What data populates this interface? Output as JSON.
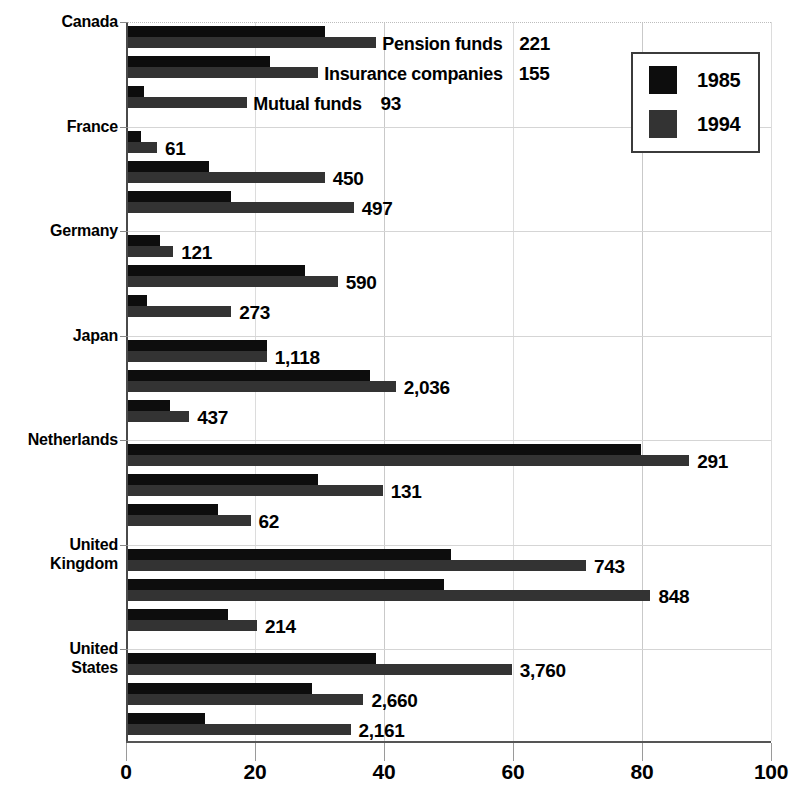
{
  "chart_data": {
    "type": "bar",
    "orientation": "horizontal",
    "title": "",
    "xlabel": "",
    "ylabel": "",
    "xlim": [
      0,
      100
    ],
    "xticks": [
      0,
      20,
      40,
      60,
      80,
      100
    ],
    "xtick_labels": [
      "0",
      "20",
      "40",
      "60",
      "80",
      "100"
    ],
    "grid": true,
    "legend_position": "top-right",
    "legend": [
      {
        "name": "1985",
        "color": "#0d0d0d"
      },
      {
        "name": "1994",
        "color": "#333333"
      }
    ],
    "categories": [
      "Canada",
      "France",
      "Germany",
      "Japan",
      "Netherlands",
      "United Kingdom",
      "United States"
    ],
    "subcategories": [
      "Pension funds",
      "Insurance companies",
      "Mutual funds"
    ],
    "groups": [
      {
        "category": "Canada",
        "label_lines": "Canada",
        "rows": [
          {
            "series": "Pension funds",
            "show_series_name": true,
            "v1985": 30.5,
            "v1994": 38.5,
            "value_label": "221"
          },
          {
            "series": "Insurance companies",
            "show_series_name": true,
            "v1985": 22.0,
            "v1994": 29.5,
            "value_label": "155"
          },
          {
            "series": "Mutual funds",
            "show_series_name": true,
            "v1985": 2.5,
            "v1994": 18.5,
            "value_label": "93"
          }
        ]
      },
      {
        "category": "France",
        "label_lines": "France",
        "rows": [
          {
            "series": "Pension funds",
            "show_series_name": false,
            "v1985": 2.0,
            "v1994": 4.5,
            "value_label": "61"
          },
          {
            "series": "Insurance companies",
            "show_series_name": false,
            "v1985": 12.5,
            "v1994": 30.5,
            "value_label": "450"
          },
          {
            "series": "Mutual funds",
            "show_series_name": false,
            "v1985": 16.0,
            "v1994": 35.0,
            "value_label": "497"
          }
        ]
      },
      {
        "category": "Germany",
        "label_lines": "Germany",
        "rows": [
          {
            "series": "Pension funds",
            "show_series_name": false,
            "v1985": 5.0,
            "v1994": 7.0,
            "value_label": "121"
          },
          {
            "series": "Insurance companies",
            "show_series_name": false,
            "v1985": 27.5,
            "v1994": 32.5,
            "value_label": "590"
          },
          {
            "series": "Mutual funds",
            "show_series_name": false,
            "v1985": 3.0,
            "v1994": 16.0,
            "value_label": "273"
          }
        ]
      },
      {
        "category": "Japan",
        "label_lines": "Japan",
        "rows": [
          {
            "series": "Pension funds",
            "show_series_name": false,
            "v1985": 21.5,
            "v1994": 21.5,
            "value_label": "1,118"
          },
          {
            "series": "Insurance companies",
            "show_series_name": false,
            "v1985": 37.5,
            "v1994": 41.5,
            "value_label": "2,036"
          },
          {
            "series": "Mutual funds",
            "show_series_name": false,
            "v1985": 6.5,
            "v1994": 9.5,
            "value_label": "437"
          }
        ]
      },
      {
        "category": "Netherlands",
        "label_lines": "Netherlands",
        "rows": [
          {
            "series": "Pension funds",
            "show_series_name": false,
            "v1985": 79.5,
            "v1994": 87.0,
            "value_label": "291"
          },
          {
            "series": "Insurance companies",
            "show_series_name": false,
            "v1985": 29.5,
            "v1994": 39.5,
            "value_label": "131"
          },
          {
            "series": "Mutual funds",
            "show_series_name": false,
            "v1985": 14.0,
            "v1994": 19.0,
            "value_label": "62"
          }
        ]
      },
      {
        "category": "United Kingdom",
        "label_lines": "United\nKingdom",
        "rows": [
          {
            "series": "Pension funds",
            "show_series_name": false,
            "v1985": 50.0,
            "v1994": 71.0,
            "value_label": "743"
          },
          {
            "series": "Insurance companies",
            "show_series_name": false,
            "v1985": 49.0,
            "v1994": 81.0,
            "value_label": "848"
          },
          {
            "series": "Mutual funds",
            "show_series_name": false,
            "v1985": 15.5,
            "v1994": 20.0,
            "value_label": "214"
          }
        ]
      },
      {
        "category": "United States",
        "label_lines": "United\nStates",
        "rows": [
          {
            "series": "Pension funds",
            "show_series_name": false,
            "v1985": 38.5,
            "v1994": 59.5,
            "value_label": "3,760"
          },
          {
            "series": "Insurance companies",
            "show_series_name": false,
            "v1985": 28.5,
            "v1994": 36.5,
            "value_label": "2,660"
          },
          {
            "series": "Mutual funds",
            "show_series_name": false,
            "v1985": 12.0,
            "v1994": 34.5,
            "value_label": "2,161"
          }
        ]
      }
    ]
  },
  "colors": {
    "series_1985": "#0d0d0d",
    "series_1994": "#333333",
    "grid": "#c9c9c9",
    "axis": "#555555",
    "background": "#ffffff"
  }
}
